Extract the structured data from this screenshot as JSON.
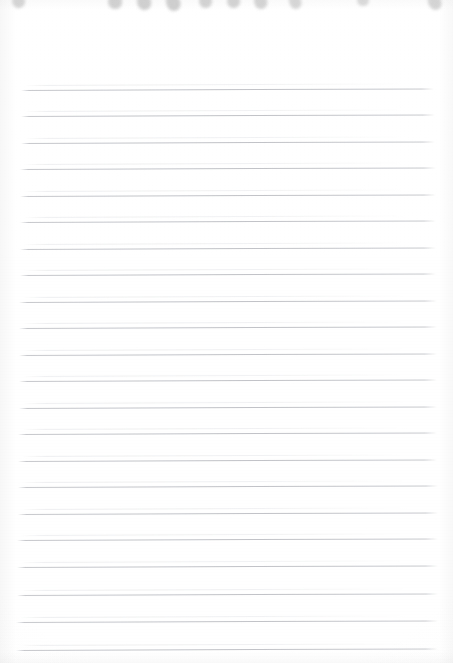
{
  "document": {
    "kind": "scanned-notepad-page",
    "title": "Blank ruled notepad page",
    "page_width": 453,
    "page_height": 663,
    "paper_color": "#ffffff",
    "rule_color": "#b0b2b8",
    "binding_mark_color": "#cacaca",
    "text_content": "",
    "written_content": [],
    "notes_label": ""
  },
  "binding": {
    "name": "spiral-binding-punch-marks",
    "count": 10,
    "marks": [
      {
        "x": 12,
        "width": 13,
        "height": 15,
        "rotate": -8,
        "opacity": 0.8
      },
      {
        "x": 108,
        "width": 14,
        "height": 16,
        "rotate": -6,
        "opacity": 0.88
      },
      {
        "x": 137,
        "width": 14,
        "height": 17,
        "rotate": -14,
        "opacity": 0.9
      },
      {
        "x": 166,
        "width": 14,
        "height": 18,
        "rotate": -20,
        "opacity": 0.92
      },
      {
        "x": 199,
        "width": 13,
        "height": 15,
        "rotate": -5,
        "opacity": 0.84
      },
      {
        "x": 227,
        "width": 13,
        "height": 15,
        "rotate": -7,
        "opacity": 0.84
      },
      {
        "x": 254,
        "width": 13,
        "height": 16,
        "rotate": -16,
        "opacity": 0.82
      },
      {
        "x": 289,
        "width": 12,
        "height": 16,
        "rotate": -18,
        "opacity": 0.76
      },
      {
        "x": 357,
        "width": 12,
        "height": 13,
        "rotate": -4,
        "opacity": 0.7
      },
      {
        "x": 428,
        "width": 13,
        "height": 17,
        "rotate": -24,
        "opacity": 0.8
      }
    ]
  },
  "ruling": {
    "name": "horizontal-ruled-lines",
    "count": 22,
    "first_line_y": 90,
    "line_spacing": 26.6,
    "left_margin": 19,
    "right_margin": 438,
    "tilt_deg": -0.22,
    "lines": [
      {
        "y": 90,
        "x1": 21,
        "x2": 434
      },
      {
        "y": 116,
        "x1": 21,
        "x2": 435
      },
      {
        "y": 143,
        "x1": 21,
        "x2": 435
      },
      {
        "y": 169,
        "x1": 20,
        "x2": 436
      },
      {
        "y": 196,
        "x1": 20,
        "x2": 436
      },
      {
        "y": 222,
        "x1": 20,
        "x2": 436
      },
      {
        "y": 249,
        "x1": 20,
        "x2": 436
      },
      {
        "y": 275,
        "x1": 20,
        "x2": 436
      },
      {
        "y": 302,
        "x1": 19,
        "x2": 437
      },
      {
        "y": 328,
        "x1": 19,
        "x2": 437
      },
      {
        "y": 355,
        "x1": 19,
        "x2": 437
      },
      {
        "y": 381,
        "x1": 19,
        "x2": 437
      },
      {
        "y": 408,
        "x1": 19,
        "x2": 437
      },
      {
        "y": 434,
        "x1": 18,
        "x2": 437
      },
      {
        "y": 461,
        "x1": 18,
        "x2": 437
      },
      {
        "y": 487,
        "x1": 18,
        "x2": 438
      },
      {
        "y": 514,
        "x1": 18,
        "x2": 438
      },
      {
        "y": 540,
        "x1": 17,
        "x2": 438
      },
      {
        "y": 567,
        "x1": 17,
        "x2": 438
      },
      {
        "y": 595,
        "x1": 17,
        "x2": 438
      },
      {
        "y": 622,
        "x1": 16,
        "x2": 438
      },
      {
        "y": 650,
        "x1": 16,
        "x2": 438
      }
    ]
  }
}
